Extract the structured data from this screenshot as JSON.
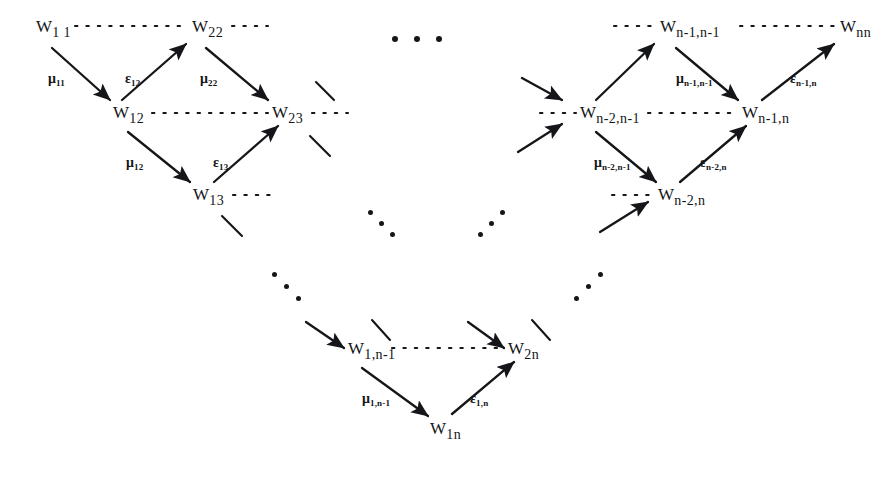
{
  "figure": {
    "type": "lattice-diagram",
    "ink_color": "#15161a",
    "background": "#ffffff"
  },
  "nodes": [
    {
      "id": "w11",
      "base": "W",
      "sub": "1 1",
      "x": 36,
      "y": 18
    },
    {
      "id": "w22",
      "base": "W",
      "sub": "22",
      "x": 192,
      "y": 18
    },
    {
      "id": "wn1n1",
      "base": "W",
      "sub": "n-1,n-1",
      "x": 660,
      "y": 18
    },
    {
      "id": "wnn",
      "base": "W",
      "sub": "nn",
      "x": 840,
      "y": 18
    },
    {
      "id": "w12",
      "base": "W",
      "sub": "12",
      "x": 113,
      "y": 104
    },
    {
      "id": "w23",
      "base": "W",
      "sub": "23",
      "x": 272,
      "y": 104
    },
    {
      "id": "wn2n1",
      "base": "W",
      "sub": "n-2,n-1",
      "x": 580,
      "y": 104
    },
    {
      "id": "wn1n",
      "base": "W",
      "sub": "n-1,n",
      "x": 742,
      "y": 104
    },
    {
      "id": "w13",
      "base": "W",
      "sub": "13",
      "x": 193,
      "y": 186
    },
    {
      "id": "wn2n",
      "base": "W",
      "sub": "n-2,n",
      "x": 658,
      "y": 186
    },
    {
      "id": "w1n1",
      "base": "W",
      "sub": "1,n-1",
      "x": 348,
      "y": 340
    },
    {
      "id": "w2n",
      "base": "W",
      "sub": "2n",
      "x": 508,
      "y": 340
    },
    {
      "id": "w1n",
      "base": "W",
      "sub": "1n",
      "x": 430,
      "y": 420
    }
  ],
  "edge_labels": [
    {
      "id": "mu11",
      "glyph": "μ",
      "sub": "11",
      "x": 48,
      "y": 72
    },
    {
      "id": "eps12",
      "glyph": "ε",
      "sub": "12",
      "x": 125,
      "y": 72
    },
    {
      "id": "mu22",
      "glyph": "μ",
      "sub": "22",
      "x": 200,
      "y": 72
    },
    {
      "id": "mu12",
      "glyph": "μ",
      "sub": "12",
      "x": 126,
      "y": 156
    },
    {
      "id": "eps13",
      "glyph": "ε",
      "sub": "13",
      "x": 213,
      "y": 156
    },
    {
      "id": "mun1n1",
      "glyph": "μ",
      "sub": "n-1,n-1",
      "x": 676,
      "y": 72
    },
    {
      "id": "epsn1n",
      "glyph": "ε",
      "sub": "n-1,n",
      "x": 790,
      "y": 72
    },
    {
      "id": "mun2n1",
      "glyph": "μ",
      "sub": "n-2,n-1",
      "x": 594,
      "y": 156
    },
    {
      "id": "epsn2n",
      "glyph": "ε",
      "sub": "n-2,n",
      "x": 700,
      "y": 156
    },
    {
      "id": "mu1n1",
      "glyph": "μ",
      "sub": "1,n-1",
      "x": 362,
      "y": 392
    },
    {
      "id": "eps1n",
      "glyph": "ε",
      "sub": "1,n",
      "x": 470,
      "y": 392
    }
  ],
  "dotted_links": [
    {
      "id": "link-w11-w22",
      "x1": 75,
      "y1": 26,
      "x2": 188,
      "y2": 26
    },
    {
      "id": "link-w22-right",
      "x1": 232,
      "y1": 26,
      "x2": 268,
      "y2": 26
    },
    {
      "id": "link-left-wn1n1",
      "x1": 614,
      "y1": 26,
      "x2": 656,
      "y2": 26
    },
    {
      "id": "link-wn1n1-wnn",
      "x1": 740,
      "y1": 26,
      "x2": 836,
      "y2": 26
    },
    {
      "id": "link-w12-w23",
      "x1": 152,
      "y1": 113,
      "x2": 268,
      "y2": 113
    },
    {
      "id": "link-w23-right",
      "x1": 312,
      "y1": 113,
      "x2": 348,
      "y2": 113
    },
    {
      "id": "link-left-wn2n1",
      "x1": 540,
      "y1": 113,
      "x2": 576,
      "y2": 113
    },
    {
      "id": "link-wn2n1-wn1n",
      "x1": 648,
      "y1": 113,
      "x2": 738,
      "y2": 113
    },
    {
      "id": "link-w13-right",
      "x1": 233,
      "y1": 195,
      "x2": 276,
      "y2": 195
    },
    {
      "id": "link-left-wn2n",
      "x1": 612,
      "y1": 195,
      "x2": 654,
      "y2": 195
    },
    {
      "id": "link-w1n1-w2n",
      "x1": 392,
      "y1": 348,
      "x2": 505,
      "y2": 348
    }
  ],
  "arrows": [
    {
      "id": "arrow-w11-w12",
      "x1": 52,
      "y1": 48,
      "x2": 110,
      "y2": 100
    },
    {
      "id": "arrow-w12-w22",
      "x1": 122,
      "y1": 100,
      "x2": 186,
      "y2": 44
    },
    {
      "id": "arrow-w22-w23",
      "x1": 206,
      "y1": 48,
      "x2": 268,
      "y2": 100
    },
    {
      "id": "arrow-w12-w13",
      "x1": 128,
      "y1": 132,
      "x2": 190,
      "y2": 182
    },
    {
      "id": "arrow-w13-w23",
      "x1": 214,
      "y1": 182,
      "x2": 278,
      "y2": 126
    },
    {
      "id": "arrow-wn2n1-wn1n1",
      "x1": 596,
      "y1": 100,
      "x2": 654,
      "y2": 44
    },
    {
      "id": "arrow-wn1n1-wn1n",
      "x1": 676,
      "y1": 48,
      "x2": 738,
      "y2": 100
    },
    {
      "id": "arrow-wn1n-wnn",
      "x1": 762,
      "y1": 100,
      "x2": 834,
      "y2": 44
    },
    {
      "id": "arrow-wn2n1-wn2n",
      "x1": 596,
      "y1": 132,
      "x2": 656,
      "y2": 182
    },
    {
      "id": "arrow-wn2n-wn1n",
      "x1": 680,
      "y1": 182,
      "x2": 746,
      "y2": 126
    },
    {
      "id": "arrow-w1n1-w1n",
      "x1": 362,
      "y1": 368,
      "x2": 428,
      "y2": 416
    },
    {
      "id": "arrow-w1n-w2n",
      "x1": 452,
      "y1": 414,
      "x2": 514,
      "y2": 362
    },
    {
      "id": "arrow-in-wn2n1-top",
      "x1": 522,
      "y1": 78,
      "x2": 562,
      "y2": 100
    },
    {
      "id": "arrow-in-wn2n1-bot",
      "x1": 518,
      "y1": 152,
      "x2": 562,
      "y2": 124
    },
    {
      "id": "arrow-in-wn2n-bot",
      "x1": 600,
      "y1": 232,
      "x2": 648,
      "y2": 202
    },
    {
      "id": "arrow-in-w1n1",
      "x1": 306,
      "y1": 322,
      "x2": 344,
      "y2": 348
    },
    {
      "id": "arrow-in-w2n",
      "x1": 468,
      "y1": 322,
      "x2": 504,
      "y2": 348
    }
  ],
  "stubs": [
    {
      "id": "stub-w23-upper",
      "x1": 316,
      "y1": 82,
      "x2": 334,
      "y2": 100
    },
    {
      "id": "stub-w23-lower",
      "x1": 310,
      "y1": 136,
      "x2": 330,
      "y2": 156
    },
    {
      "id": "stub-w13-lower",
      "x1": 222,
      "y1": 216,
      "x2": 242,
      "y2": 236
    },
    {
      "id": "stub-w1n1-up",
      "x1": 372,
      "y1": 320,
      "x2": 390,
      "y2": 340
    },
    {
      "id": "stub-w2n-up",
      "x1": 532,
      "y1": 320,
      "x2": 550,
      "y2": 340
    }
  ],
  "ellipses": [
    {
      "id": "ellipsis-top-center",
      "orientation": "horizontal",
      "x": 392,
      "y": 36,
      "count": 3,
      "step": 22,
      "size": 6
    },
    {
      "id": "ellipsis-mid-left-down",
      "orientation": "down",
      "x": 368,
      "y": 210,
      "count": 3,
      "step": 11,
      "size": 5
    },
    {
      "id": "ellipsis-mid-right-up",
      "orientation": "up",
      "x": 478,
      "y": 232,
      "count": 3,
      "step": 11,
      "size": 5
    },
    {
      "id": "ellipsis-low-left-down",
      "orientation": "down",
      "x": 272,
      "y": 272,
      "count": 3,
      "step": 12,
      "size": 5
    },
    {
      "id": "ellipsis-low-right-up",
      "orientation": "up",
      "x": 574,
      "y": 296,
      "count": 3,
      "step": 12,
      "size": 5
    }
  ]
}
